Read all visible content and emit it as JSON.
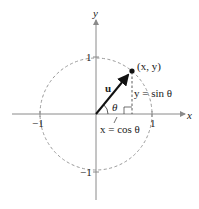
{
  "figure": {
    "type": "unit-circle-diagram",
    "axes": {
      "x_label": "x",
      "y_label": "y"
    },
    "ticks": {
      "x_pos": "1",
      "x_neg": "−1",
      "y_pos": "1",
      "y_neg": "−1"
    },
    "point_label": "(x, y)",
    "vector_label": "u",
    "angle_label": "θ",
    "vertical_label": "y = sin θ",
    "horizontal_label": "x = cos θ",
    "colors": {
      "axis": "#8a8a8a",
      "circle": "#9a9a9a",
      "vector": "#111111",
      "text": "#222222"
    }
  }
}
